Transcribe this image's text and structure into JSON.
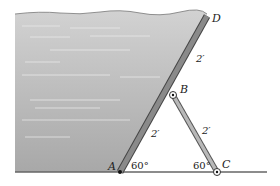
{
  "figure": {
    "type": "statics-gate-diagram",
    "points": {
      "A": {
        "label": "A",
        "x": 120,
        "y": 172
      },
      "B": {
        "label": "B",
        "x": 173,
        "y": 95
      },
      "C": {
        "label": "C",
        "x": 217,
        "y": 172
      },
      "D": {
        "label": "D",
        "x": 207,
        "y": 16
      }
    },
    "dimensions": {
      "BD": "2′",
      "AB": "2′",
      "BC": "2′"
    },
    "angles": {
      "A": "60°",
      "C": "60°"
    },
    "colors": {
      "water_top": "#c8c8c8",
      "water_bottom": "#a9a9a9",
      "gate": "#8a8a8a",
      "gate_edge": "#555555",
      "strut": "#b0b0b0",
      "ground": "#666666"
    }
  }
}
